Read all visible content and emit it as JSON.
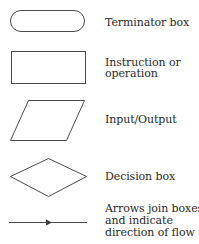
{
  "legend": {
    "items": [
      {
        "shape": "terminator",
        "label_lines": [
          "Terminator box"
        ]
      },
      {
        "shape": "rectangle",
        "label_lines": [
          "Instruction or",
          "operation"
        ]
      },
      {
        "shape": "parallelogram",
        "label_lines": [
          "Input/Output"
        ]
      },
      {
        "shape": "diamond",
        "label_lines": [
          "Decision box"
        ]
      },
      {
        "shape": "arrow",
        "label_lines": [
          "Arrows join boxes",
          "and indicate",
          "direction of flow"
        ]
      }
    ]
  },
  "colors": {
    "stroke": "#4a4a4a",
    "text": "#2a2a2a",
    "background": "#ffffff"
  }
}
